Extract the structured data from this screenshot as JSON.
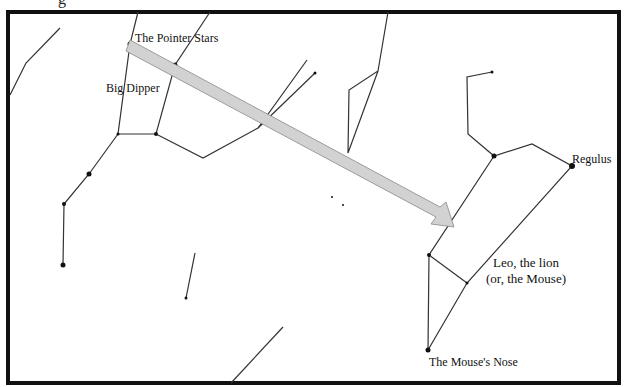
{
  "diagram": {
    "labels": {
      "pointer_stars": "The Pointer Stars",
      "big_dipper": "Big Dipper",
      "regulus": "Regulus",
      "leo_line1": "Leo, the lion",
      "leo_line2": "(or, the Mouse)",
      "mouse_nose": "The Mouse's Nose",
      "top_cutoff": "g"
    },
    "colors": {
      "border": "#111111",
      "lines": "#333333",
      "arrow_fill": "#d2d2d2",
      "arrow_stroke": "#888888"
    }
  }
}
